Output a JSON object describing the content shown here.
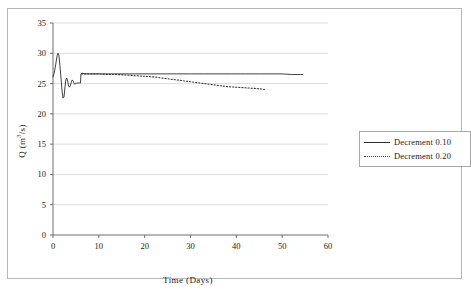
{
  "chart_data": {
    "type": "line",
    "title": "",
    "xlabel": "Time (Days)",
    "ylabel": "Q (m3/s)",
    "ylabel_parts": {
      "pre": "Q (m",
      "sup": "3",
      "post": "/s)"
    },
    "xlim": [
      0,
      60
    ],
    "ylim": [
      0,
      35
    ],
    "xticks": [
      0,
      10,
      20,
      30,
      40,
      50,
      60
    ],
    "yticks": [
      0,
      5,
      10,
      15,
      20,
      25,
      30,
      35
    ],
    "grid": "horizontal",
    "legend_position": "right",
    "series": [
      {
        "name": "Decrement 0.10",
        "style": "solid",
        "color": "#2b2b2b",
        "x": [
          0,
          0.3,
          0.6,
          0.9,
          1.1,
          1.3,
          1.5,
          1.8,
          2.0,
          2.2,
          2.4,
          2.6,
          2.8,
          3.0,
          3.2,
          3.4,
          3.6,
          3.8,
          4.0,
          4.2,
          4.4,
          4.6,
          4.8,
          5.0,
          5.2,
          5.4,
          5.6,
          5.8,
          6.0,
          6.1,
          6.3,
          7.0,
          8.0,
          10.0,
          12.0,
          15.0,
          18.0,
          21.0,
          24.0,
          27.0,
          30.0,
          33.0,
          36.0,
          39.0,
          42.0,
          45.0,
          48.0,
          50.0,
          52.0,
          54.0,
          54.5
        ],
        "y": [
          26.1,
          26.9,
          28.2,
          29.6,
          30.0,
          29.6,
          28.0,
          25.4,
          23.6,
          22.6,
          22.8,
          24.3,
          25.6,
          25.9,
          25.4,
          24.6,
          24.4,
          24.7,
          25.3,
          25.6,
          25.4,
          25.0,
          24.9,
          25.0,
          25.1,
          25.1,
          25.1,
          25.1,
          25.1,
          26.6,
          26.7,
          26.6,
          26.6,
          26.6,
          26.6,
          26.6,
          26.6,
          26.6,
          26.6,
          26.6,
          26.6,
          26.6,
          26.6,
          26.6,
          26.6,
          26.6,
          26.6,
          26.6,
          26.5,
          26.5,
          26.5
        ]
      },
      {
        "name": "Decrement 0.20",
        "style": "dotted",
        "color": "#3a3a3a",
        "x": [
          6.2,
          7.0,
          8.0,
          9.0,
          10.0,
          12.0,
          14.0,
          16.0,
          18.0,
          20.0,
          22.0,
          24.0,
          26.0,
          28.0,
          30.0,
          32.0,
          34.0,
          36.0,
          38.0,
          40.0,
          42.0,
          44.0,
          45.5,
          46.5
        ],
        "y": [
          26.6,
          26.6,
          26.6,
          26.6,
          26.6,
          26.5,
          26.5,
          26.4,
          26.3,
          26.2,
          26.1,
          25.9,
          25.7,
          25.5,
          25.3,
          25.1,
          24.9,
          24.7,
          24.5,
          24.4,
          24.3,
          24.2,
          24.1,
          24.0
        ]
      }
    ]
  },
  "legend": {
    "entries": [
      {
        "label": "Decrement 0.10"
      },
      {
        "label": "Decrement 0.20"
      }
    ]
  }
}
